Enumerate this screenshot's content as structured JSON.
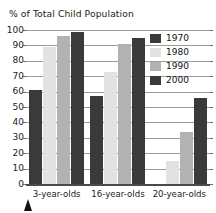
{
  "chart_data": {
    "type": "bar",
    "title": "% of Total Child Population",
    "xlabel": "",
    "ylabel": "",
    "ylim": [
      0,
      100
    ],
    "ytick_step": 10,
    "yticks": [
      100,
      90,
      80,
      70,
      60,
      50,
      40,
      30,
      20,
      10,
      0
    ],
    "grid": true,
    "legend_position": "top-right",
    "categories": [
      "3-year-olds",
      "16-year-olds",
      "20-year-olds"
    ],
    "series": [
      {
        "name": "1970",
        "color": "#3a3a3a",
        "values": [
          61,
          57,
          0
        ]
      },
      {
        "name": "1980",
        "color": "#e2e2e2",
        "values": [
          89,
          73,
          15
        ]
      },
      {
        "name": "1990",
        "color": "#b2b2b2",
        "values": [
          96,
          91,
          34
        ]
      },
      {
        "name": "2000",
        "color": "#3a3a3a",
        "values": [
          99,
          95,
          56
        ]
      }
    ]
  },
  "legend": {
    "items": [
      {
        "label": "1970",
        "color": "#3a3a3a"
      },
      {
        "label": "1980",
        "color": "#e2e2e2"
      },
      {
        "label": "1990",
        "color": "#b2b2b2"
      },
      {
        "label": "2000",
        "color": "#3a3a3a"
      }
    ]
  },
  "marker": {
    "name": "pointer-triangle",
    "color": "#111111"
  }
}
